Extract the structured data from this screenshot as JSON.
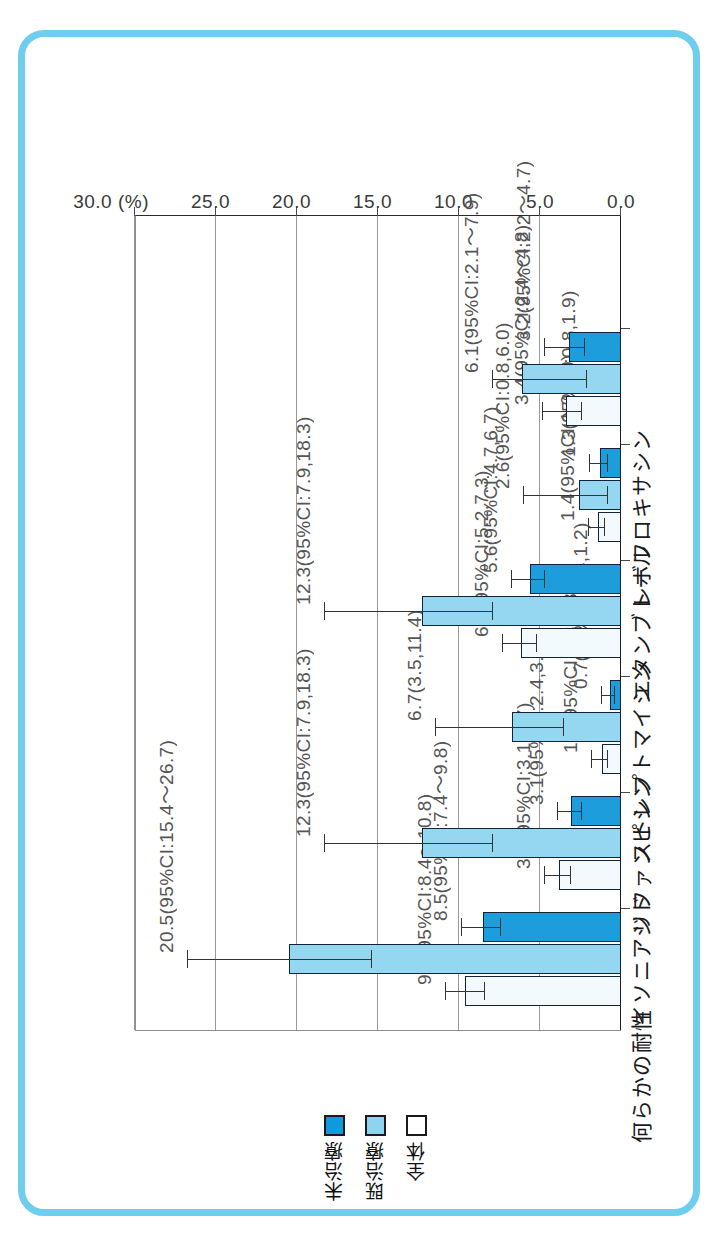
{
  "chart_data": {
    "type": "bar",
    "title": "",
    "xlabel": "",
    "ylabel": "",
    "unit_label": "(%)",
    "orientation": "rotated-vertical",
    "grid": true,
    "legend_position": "bottom",
    "axis_ticks": [
      "0.0",
      "5.0",
      "10.0",
      "15.0",
      "20.0",
      "25.0",
      "30.0"
    ],
    "axis_tick_values": [
      0.0,
      5.0,
      10.0,
      15.0,
      20.0,
      25.0,
      30.0
    ],
    "ylim": [
      0,
      30
    ],
    "categories": [
      "何らかの耐性",
      "イソニアジド",
      "リファンピシン",
      "ストレプトマイシン",
      "エタンブトール",
      "レボフロキサシン"
    ],
    "series": [
      {
        "name": "全体",
        "color": "#f2fafd",
        "values": [
          9.6,
          3.8,
          1.2,
          6.2,
          1.4,
          3.4
        ],
        "ci_low": [
          8.4,
          3.1,
          0.8,
          5.2,
          1.0,
          2.4
        ],
        "ci_high": [
          10.8,
          4.7,
          1.8,
          7.3,
          2.0,
          4.8
        ],
        "labels": [
          "9.6(95%CI:8.4〜10.8)",
          "3.8(95%CI:3.1,4.7)",
          "1.2(95%CI:0.8,1.8)",
          "6.2(95%CI:5.2,7.3)",
          "1.4(95%CI:1.0,2.0)",
          "3.4(95%CI:2.4〜4.8)"
        ]
      },
      {
        "name": "既治療",
        "color": "#95d6f0",
        "values": [
          20.5,
          12.3,
          6.7,
          12.3,
          2.6,
          6.1
        ],
        "ci_low": [
          15.4,
          7.9,
          3.5,
          7.9,
          0.8,
          2.1
        ],
        "ci_high": [
          26.7,
          18.3,
          11.4,
          18.3,
          6.0,
          7.9
        ],
        "labels": [
          "20.5(95%CI:15.4〜26.7)",
          "12.3(95%CI:7.9,18.3)",
          "6.7(3.5,11.4)",
          "12.3(95%CI:7.9,18.3)",
          "2.6(95%CI:0.8,6.0)",
          "6.1(95%CI:2.1〜7.9)"
        ]
      },
      {
        "name": "未治療",
        "color": "#1d9ddb",
        "values": [
          8.5,
          3.1,
          0.7,
          5.6,
          1.3,
          3.2
        ],
        "ci_low": [
          7.4,
          2.4,
          0.4,
          4.7,
          0.8,
          2.2
        ],
        "ci_high": [
          9.8,
          3.9,
          1.2,
          6.7,
          1.9,
          4.7
        ],
        "labels": [
          "8.5(95%CI:7.4〜9.8)",
          "3.1(95%CI:2.4,3.9)",
          "0.7(95%CI:0.4,1.2)",
          "5.6(95%CI:4.7,6.7)",
          "1.3(95%CI:0.8,1.9)",
          "3.2(95%CI:2.2〜4.7)"
        ]
      }
    ]
  },
  "legend": {
    "items": [
      {
        "label": "全体",
        "swatch": "overall"
      },
      {
        "label": "既治療",
        "swatch": "treated"
      },
      {
        "label": "未治療",
        "swatch": "untreated"
      }
    ]
  },
  "colors": {
    "frame": "#6fcdee",
    "overall": "#f2fafd",
    "treated": "#95d6f0",
    "untreated": "#1d9ddb",
    "outline": "#11243a",
    "grid": "#9a9a9a"
  }
}
